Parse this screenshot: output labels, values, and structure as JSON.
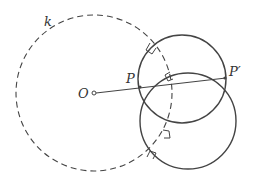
{
  "diagram": {
    "labels": {
      "circle_k": "k",
      "center_O": "O",
      "point_P": "P",
      "point_P_prime": "P′"
    },
    "colors": {
      "stroke": "#444444",
      "background": "#ffffff"
    },
    "elements": [
      {
        "type": "dashed-circle",
        "name": "k",
        "center": [
          94,
          93
        ],
        "r": 78
      },
      {
        "type": "circle",
        "name": "upper-orthogonal-circle",
        "center": [
          182,
          80
        ],
        "r": 44
      },
      {
        "type": "circle",
        "name": "lower-orthogonal-circle",
        "center": [
          188,
          122
        ],
        "r": 48
      },
      {
        "type": "segment",
        "name": "O-to-P-prime",
        "from": [
          94,
          93
        ],
        "to": [
          225,
          78
        ]
      },
      {
        "type": "point",
        "name": "O",
        "at": [
          94,
          93
        ]
      },
      {
        "type": "point",
        "name": "P",
        "at": [
          140,
          87
        ]
      },
      {
        "type": "point",
        "name": "P'",
        "at": [
          225,
          78
        ]
      }
    ]
  }
}
